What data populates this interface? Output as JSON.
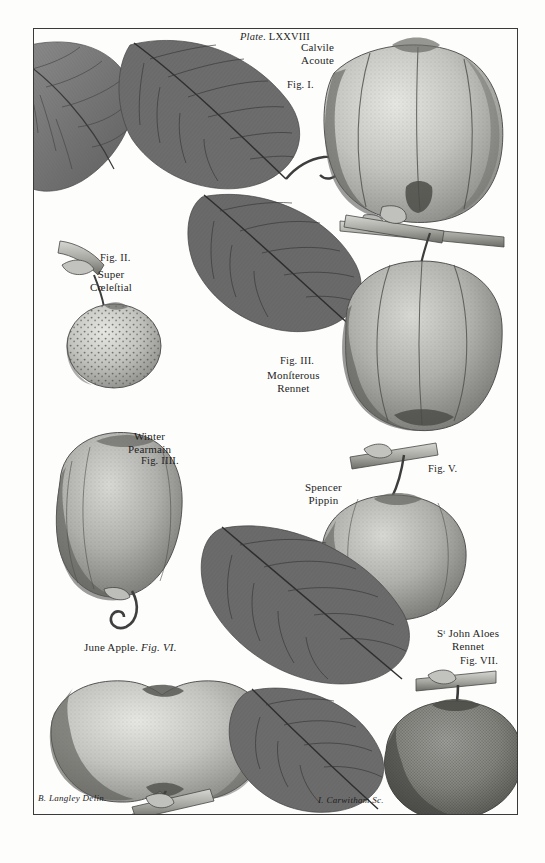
{
  "plate": {
    "plate_label": "Plate.",
    "plate_number": "LXXVIII",
    "title_line1": "Calvile",
    "title_line2": "Acoute"
  },
  "figures": [
    {
      "id": "fig-1",
      "fig_label": "Fig. I.",
      "name_line1": "Calvile",
      "name_line2": "Acoute",
      "subject": "ribbed calville apple with leafy branch"
    },
    {
      "id": "fig-2",
      "fig_label": "Fig. II.",
      "name_line1": "Super",
      "name_line2": "Cœleſtial",
      "subject": "small russeted dotted apple"
    },
    {
      "id": "fig-3",
      "fig_label": "Fig. III.",
      "name_line1": "Monſterous",
      "name_line2": "Rennet",
      "subject": "large ribbed rennet apple with leaf"
    },
    {
      "id": "fig-4",
      "fig_label": "Fig. IIII.",
      "name_line1": "Winter",
      "name_line2": "Pearmain",
      "subject": "elongated pearmain apple with stalk"
    },
    {
      "id": "fig-5",
      "fig_label": "Fig. V.",
      "name_line1": "Spencer",
      "name_line2": "Pippin",
      "subject": "round pippin apple with branch and leaf"
    },
    {
      "id": "fig-6",
      "fig_label": "Fig. VI.",
      "name_line1": "June Apple",
      "name_line2": "",
      "subject": "flattened june apple with curved stalk"
    },
    {
      "id": "fig-7",
      "fig_label": "Fig. VII.",
      "name_line1": "Sᵗ John Aloes",
      "name_line2": "Rennet",
      "subject": "dark toned rennet apple with stalk"
    }
  ],
  "credits": {
    "draughtsman": "B. Langley Delin.",
    "engraver": "I. Carwitham Sc."
  },
  "palette": {
    "paper": "#fdfdfc",
    "ink": "#1d1d1d",
    "leaf_dark": "#6f6f6f",
    "leaf_mid": "#8a8a8a",
    "apple_light": "#cfcfcb",
    "apple_mid": "#a9a9a5",
    "apple_dark": "#757571",
    "border": "#3a3a3a"
  }
}
